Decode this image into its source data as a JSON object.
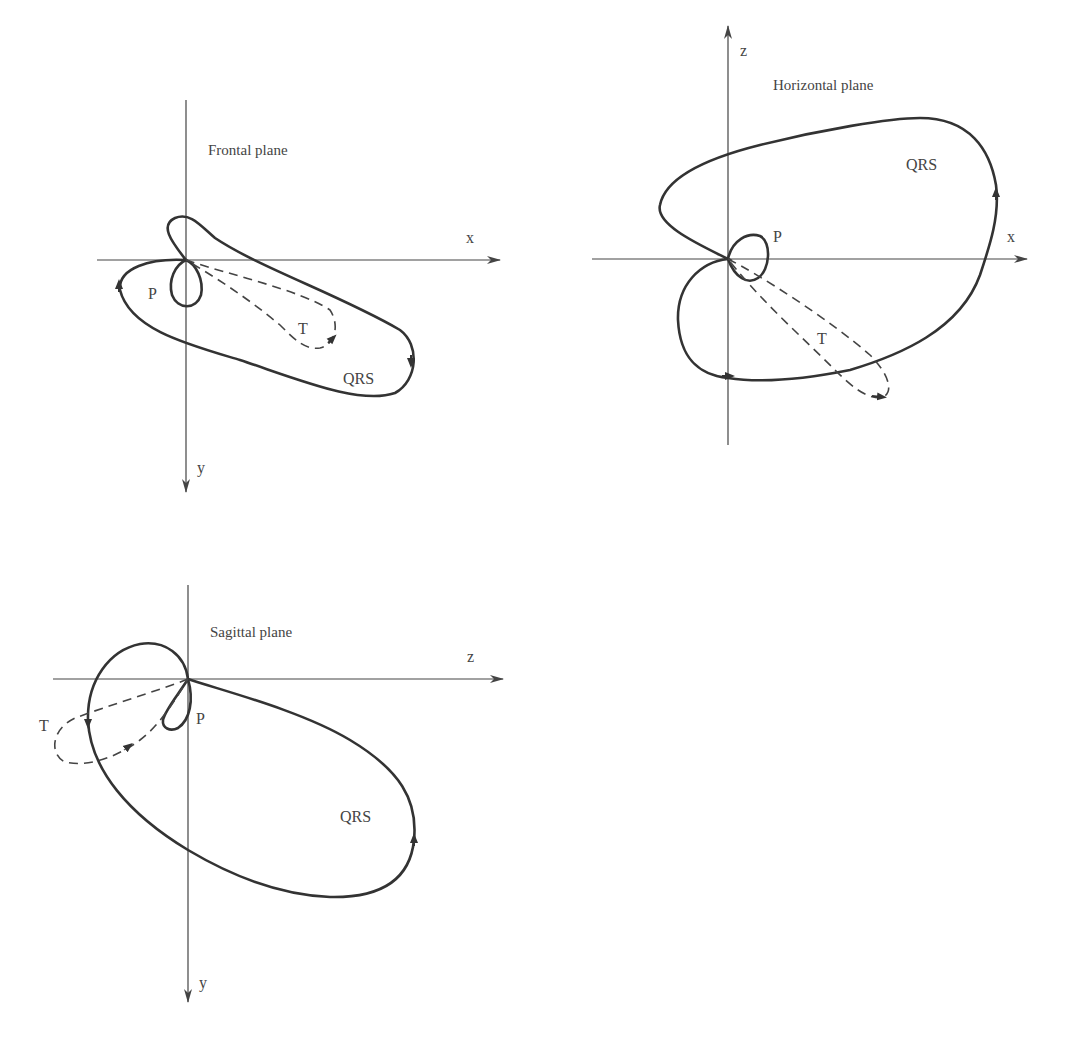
{
  "figure": {
    "panels": [
      {
        "id": "frontal",
        "title": "Frontal plane",
        "axes": {
          "horizontal": "x",
          "vertical": "y"
        },
        "loops": {
          "qrs": "QRS",
          "p": "P",
          "t": "T"
        }
      },
      {
        "id": "horizontal",
        "title": "Horizontal plane",
        "axes": {
          "horizontal": "x",
          "vertical": "z"
        },
        "loops": {
          "qrs": "QRS",
          "p": "P",
          "t": "T"
        }
      },
      {
        "id": "sagittal",
        "title": "Sagittal plane",
        "axes": {
          "horizontal": "z",
          "vertical": "y"
        },
        "loops": {
          "qrs": "QRS",
          "p": "P",
          "t": "T"
        }
      }
    ],
    "legend_style": {
      "qrs_loop": "solid thick",
      "p_loop": "solid thick",
      "t_loop": "dashed"
    },
    "colors": {
      "stroke": "#333333",
      "axis": "#444444",
      "background": "#ffffff"
    }
  }
}
